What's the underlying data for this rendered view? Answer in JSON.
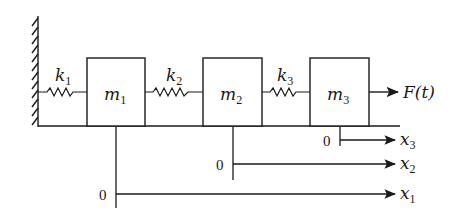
{
  "diagram": {
    "type": "three-mass spring system",
    "wall": {
      "label": ""
    },
    "springs": [
      {
        "id": "k1",
        "label": "k",
        "sub": "1"
      },
      {
        "id": "k2",
        "label": "k",
        "sub": "2"
      },
      {
        "id": "k3",
        "label": "k",
        "sub": "3"
      }
    ],
    "masses": [
      {
        "id": "m1",
        "label": "m",
        "sub": "1"
      },
      {
        "id": "m2",
        "label": "m",
        "sub": "2"
      },
      {
        "id": "m3",
        "label": "m",
        "sub": "3"
      }
    ],
    "force": {
      "label": "F(t)"
    },
    "axes": [
      {
        "id": "x3",
        "origin": "0",
        "label": "x",
        "sub": "3"
      },
      {
        "id": "x2",
        "origin": "0",
        "label": "x",
        "sub": "2"
      },
      {
        "id": "x1",
        "origin": "0",
        "label": "x",
        "sub": "1"
      }
    ],
    "colors": {
      "stroke": "#1a1a1a",
      "background": "#ffffff"
    }
  }
}
